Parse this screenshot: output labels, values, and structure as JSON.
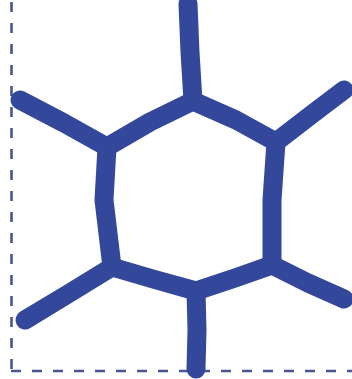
{
  "canvas": {
    "width": 352,
    "height": 379,
    "background_color": "#ffffff",
    "title": "hand-drawn hexagonal molecule sketch"
  },
  "colors": {
    "ink_blue": "#33489B",
    "guide_blue": "#4A5590",
    "background": "#ffffff"
  },
  "guides": {
    "name": "dashed-crop-guides",
    "stroke_color": "#4A5590",
    "stroke_width": 2.6,
    "dash_pattern": "10 11",
    "left_edge": {
      "label": "left-dashed-guide",
      "x": 11.5,
      "y_start": 2,
      "y_end": 372
    },
    "bottom_edge": {
      "label": "bottom-dashed-guide",
      "y": 371,
      "x_start": 11,
      "x_end": 352
    }
  },
  "sketch": {
    "name": "hexagon-with-four-substituents",
    "stroke_color": "#33489B",
    "stroke_width": 19,
    "description": "Thick marker drawing of a six-membered ring with four external bonds: one up from the top vertex, one down from the bottom vertex, one to the upper-left, and one to the upper-right, plus one to the lower-left and one to the lower-right.",
    "strokes": [
      {
        "name": "ring-edge-top-left",
        "points": "193,101 150,122 107,147"
      },
      {
        "name": "ring-edge-top-right",
        "points": "193,101 236,120 276,142"
      },
      {
        "name": "ring-edge-left",
        "points": "107,147 104,200 112,267"
      },
      {
        "name": "ring-edge-right",
        "points": "276,142 272,200 272,265"
      },
      {
        "name": "ring-edge-bottom-left",
        "points": "112,267 153,279 196,291"
      },
      {
        "name": "ring-edge-bottom-right",
        "points": "196,291 235,278 272,265"
      },
      {
        "name": "bond-top-stem",
        "points": "193,101 190,52 188,4"
      },
      {
        "name": "bond-bottom-stem",
        "points": "196,291 197,330 196,369"
      },
      {
        "name": "bond-upper-left-arm",
        "points": "107,147 64,123 20,100"
      },
      {
        "name": "bond-upper-right-arm",
        "points": "276,142 311,115 344,90"
      },
      {
        "name": "bond-lower-left-arm",
        "points": "112,267 68,294 25,320"
      },
      {
        "name": "bond-lower-right-arm",
        "points": "272,265 308,283 344,299"
      }
    ]
  }
}
